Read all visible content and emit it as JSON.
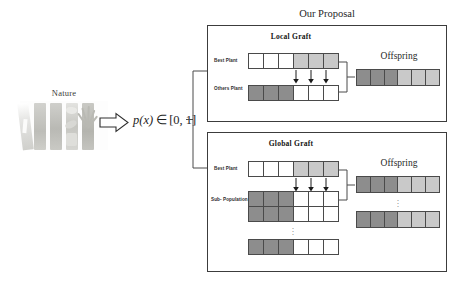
{
  "figure": {
    "nature": {
      "label": "Nature",
      "photo_icon": "plant-stems-photo"
    },
    "flow_arrow_icon": "right-block-arrow-icon",
    "probability": {
      "function": "p(x)",
      "relation": "∈",
      "interval": "[0, 1]",
      "full": "p(x) ∈ [0, 1]"
    },
    "proposal_title": "Our Proposal",
    "panels": [
      {
        "id": "local-graft",
        "title": "Local Graft",
        "rows": [
          {
            "label": "Best Plant",
            "cells": [
              "white",
              "white",
              "white",
              "light",
              "light",
              "light"
            ]
          },
          {
            "label": "Others\nPlant",
            "cells": [
              "dark",
              "dark",
              "dark",
              "white",
              "white",
              "white"
            ]
          }
        ],
        "row_labels": [
          "Best Plant",
          "Others",
          "Plant"
        ],
        "arrow_count": 3,
        "offspring": {
          "title": "Offspring",
          "rows": [
            {
              "cells": [
                "dark",
                "dark",
                "dark",
                "light",
                "light",
                "light"
              ]
            }
          ]
        }
      },
      {
        "id": "global-graft",
        "title": "Global Graft",
        "rows": [
          {
            "label": "Best Plant",
            "cells": [
              "white",
              "white",
              "white",
              "light",
              "light",
              "light"
            ]
          }
        ],
        "row_labels": [
          "Best Plant",
          "Sub-",
          "Population"
        ],
        "arrow_count": 3,
        "subpopulation": {
          "label_line1": "Sub-",
          "label_line2": "Population",
          "rows": [
            {
              "cells": [
                "dark",
                "dark",
                "dark",
                "white",
                "white",
                "white"
              ]
            },
            {
              "cells": [
                "dark",
                "dark",
                "dark",
                "white",
                "white",
                "white"
              ]
            },
            {
              "cells": [
                "dark",
                "dark",
                "dark",
                "white",
                "white",
                "white"
              ]
            }
          ],
          "ellipsis": "⋮"
        },
        "offspring": {
          "title": "Offspring",
          "rows": [
            {
              "cells": [
                "dark",
                "dark",
                "dark",
                "light",
                "light",
                "light"
              ]
            },
            {
              "cells": [
                "dark",
                "dark",
                "dark",
                "light",
                "light",
                "light"
              ]
            }
          ],
          "ellipsis": "⋮"
        }
      }
    ],
    "colors": {
      "cell_white": "#ffffff",
      "cell_light": "#c9c9c9",
      "cell_dark": "#8d8d8d",
      "stroke": "#4a4a4a",
      "panel_border": "#3c3c3c",
      "text": "#1f1f1f",
      "background": "#ffffff"
    }
  }
}
